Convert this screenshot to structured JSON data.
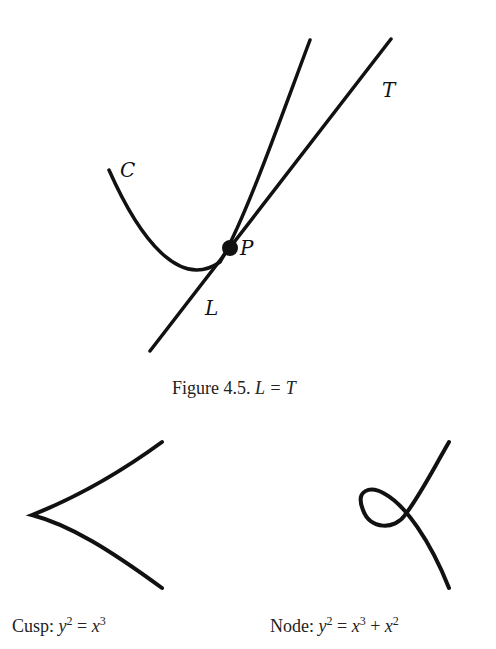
{
  "figure_top": {
    "labels": {
      "curve": "C",
      "tangent": "T",
      "point": "P",
      "line": "L"
    },
    "caption_prefix": "Figure 4.5.",
    "caption_math": "L = T"
  },
  "figure_bottom": {
    "cusp": {
      "name": "Cusp:",
      "equation_lhs": "y",
      "lhs_exp": "2",
      "equation_rhs": "x",
      "rhs_exp": "3"
    },
    "node": {
      "name": "Node:",
      "equation_lhs": "y",
      "lhs_exp": "2",
      "rhs_a": "x",
      "rhs_a_exp": "3",
      "plus": "+",
      "rhs_b": "x",
      "rhs_b_exp": "2"
    }
  }
}
